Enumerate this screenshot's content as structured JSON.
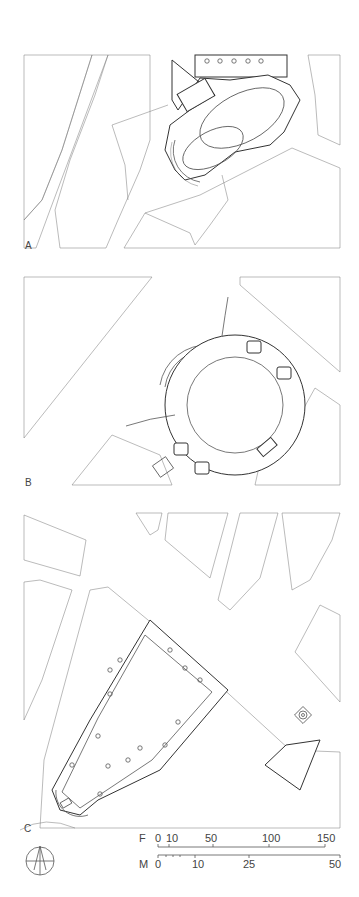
{
  "plans": [
    {
      "label": "A",
      "description": "site plan with elongated oval church and semicircular apse"
    },
    {
      "label": "B",
      "description": "site plan with circular centralized church with radiating chapels"
    },
    {
      "label": "C",
      "description": "site plan with rectangular church on diagonal street"
    }
  ],
  "north_arrow": {
    "icon": "north-arrow-icon"
  },
  "scale": {
    "feet": {
      "unit": "F",
      "ticks": [
        "0",
        "10",
        "50",
        "100",
        "150"
      ]
    },
    "meters": {
      "unit": "M",
      "ticks": [
        "0",
        "10",
        "25",
        "50"
      ]
    }
  },
  "colors": {
    "line": "#555555",
    "background": "#ffffff"
  }
}
